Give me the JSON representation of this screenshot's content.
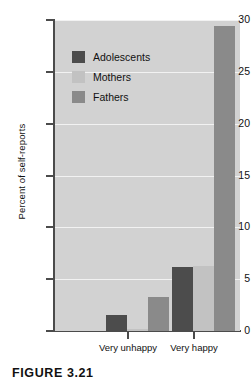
{
  "chart_data": {
    "type": "bar",
    "title": "",
    "xlabel": "",
    "ylabel": "Percent of self-reports",
    "categories": [
      "Very unhappy",
      "Very happy"
    ],
    "series": [
      {
        "name": "Adolescents",
        "color": "#4c4c4c",
        "values": [
          1.5,
          6.2
        ]
      },
      {
        "name": "Mothers",
        "color": "#c2c2c2",
        "values": [
          0.2,
          6.3
        ]
      },
      {
        "name": "Fathers",
        "color": "#8a8a8a",
        "values": [
          3.3,
          29.4
        ]
      }
    ],
    "ylim": [
      0,
      30
    ],
    "yticks": [
      0,
      5,
      10,
      15,
      20,
      25,
      30
    ],
    "ytick_labels": [
      "0",
      "5",
      "10",
      "15",
      "20",
      "25",
      "30"
    ],
    "grid": true,
    "grid_color": "#f2f2f2",
    "plot_background": "#d2d2d2",
    "page_background": "#ffffff",
    "axis_color": "#4b4b4b",
    "legend_position": "upper-left-inside"
  },
  "figure": {
    "caption": "FIGURE 3.21"
  }
}
